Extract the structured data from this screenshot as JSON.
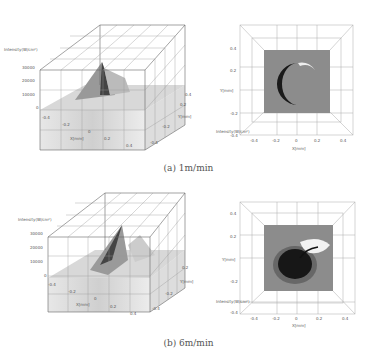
{
  "figures": [
    {
      "caption": "(a) 1m/min",
      "surface_plot": {
        "z_label": "Intensity(W/cm²)",
        "z_ticks": [
          "30000",
          "20000",
          "10000",
          "0"
        ],
        "x_label": "X[mm]",
        "x_ticks": [
          "-0.4",
          "-0.2",
          "0",
          "0.2",
          "0.4"
        ],
        "y_label": "Y[mm]",
        "y_ticks": [
          "0.4",
          "0.2",
          "0",
          "-0.2",
          "-0.4"
        ]
      },
      "top_view": {
        "x_label": "X[mm]",
        "y_label": "Y[mm]",
        "x_ticks": [
          "-0.4",
          "-0.2",
          "0",
          "0.2",
          "0.4"
        ],
        "y_ticks": [
          "0.4",
          "0.2",
          "0",
          "-0.2",
          "-0.4"
        ],
        "corner_label": "Intensity(W/cm²)"
      }
    },
    {
      "caption": "(b) 6m/min",
      "surface_plot": {
        "z_label": "Intensity(W/cm²)",
        "z_ticks": [
          "30000",
          "20000",
          "10000",
          "0"
        ],
        "x_label": "X[mm]",
        "x_ticks": [
          "-0.4",
          "-0.2",
          "0",
          "0.2",
          "0.4"
        ],
        "y_label": "Y[mm]",
        "y_ticks": [
          "0.4",
          "0.2",
          "0",
          "-0.2",
          "-0.4"
        ]
      },
      "top_view": {
        "x_label": "X[mm]",
        "y_label": "Y[mm]",
        "x_ticks": [
          "-0.4",
          "-0.2",
          "0",
          "0.2",
          "0.4"
        ],
        "y_ticks": [
          "0.4",
          "0.2",
          "0",
          "-0.2",
          "-0.4"
        ],
        "corner_label": "Intensity(W/cm²)"
      }
    }
  ]
}
